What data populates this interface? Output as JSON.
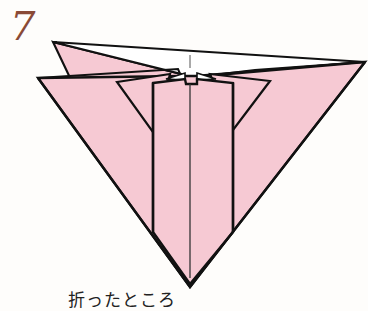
{
  "step": {
    "number": "7"
  },
  "caption": {
    "text": "折ったところ"
  },
  "colors": {
    "paper": "#f6c9d3",
    "outline": "#111111",
    "background": "#fefdfb",
    "step_number": "#8a4a36"
  },
  "diagram": {
    "icon": "origami-fold-diagram"
  }
}
